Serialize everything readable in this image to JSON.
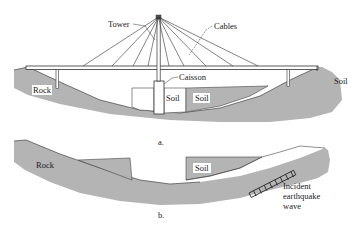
{
  "figure": {
    "colors": {
      "ground": "#b4b4b4",
      "ground_stroke": "#333333",
      "line": "#333333",
      "soil_white": "#ffffff",
      "background": "#ffffff"
    },
    "panel_a": {
      "caption": "a.",
      "labels": {
        "tower": "Tower",
        "cables": "Cables",
        "caisson": "Caisson",
        "rock": "Rock",
        "soil_left": "Soil",
        "soil_center": "Soil",
        "soil_right": "Soil"
      }
    },
    "panel_b": {
      "caption": "b.",
      "labels": {
        "rock": "Rock",
        "soil": "Soil",
        "wave_line1": "Incident",
        "wave_line2": "earthquake",
        "wave_line3": "wave"
      }
    }
  }
}
